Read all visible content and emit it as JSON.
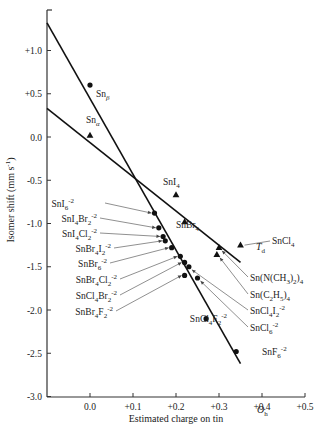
{
  "chart_data": {
    "type": "scatter",
    "title": "",
    "xlabel": "Estimated charge on tin",
    "ylabel": "Isomer shift (mm s⁻¹)",
    "xlim": [
      -0.1,
      0.5
    ],
    "ylim": [
      -3.0,
      1.5
    ],
    "x_ticks": [
      0.0,
      0.1,
      0.2,
      0.3,
      0.4,
      0.5
    ],
    "x_tick_labels": [
      "0.0",
      "+0.1",
      "+0.2",
      "+0.3",
      "+0.4",
      "+0.5"
    ],
    "y_ticks": [
      1.0,
      0.5,
      0.0,
      -0.5,
      -1.0,
      -1.5,
      -2.0,
      -2.5,
      -3.0
    ],
    "y_tick_labels": [
      "+1.0",
      "+0.5",
      "0.0",
      "-0.5",
      "-1.0",
      "-1.5",
      "-2.0",
      "-2.5",
      "-3.0"
    ],
    "grid": false,
    "lines": [
      {
        "name": "Oh",
        "label": "O_h",
        "x": [
          -0.1,
          0.35
        ],
        "y": [
          1.32,
          -2.62
        ]
      },
      {
        "name": "Td",
        "label": "T_d",
        "x": [
          -0.1,
          0.35
        ],
        "y": [
          0.33,
          -1.45
        ]
      }
    ],
    "series": [
      {
        "name": "Octahedral (circles)",
        "marker": "circle",
        "points": [
          {
            "label": "Snβ",
            "x": 0.0,
            "y": 0.6
          },
          {
            "label": "SnI6^-2",
            "x": 0.15,
            "y": -0.88
          },
          {
            "label": "SnI4Br2^-2",
            "x": 0.16,
            "y": -1.05
          },
          {
            "label": "SnI4Cl2^-2",
            "x": 0.17,
            "y": -1.15
          },
          {
            "label": "SnBr4I2^-2",
            "x": 0.175,
            "y": -1.2
          },
          {
            "label": "SnBr6^-2",
            "x": 0.19,
            "y": -1.28
          },
          {
            "label": "SnBr4Cl2^-2",
            "x": 0.21,
            "y": -1.38
          },
          {
            "label": "SnCl4Br2^-2",
            "x": 0.22,
            "y": -1.45
          },
          {
            "label": "SnBr4F2^-2",
            "x": 0.22,
            "y": -1.6
          },
          {
            "label": "SnCl6^-2",
            "x": 0.25,
            "y": -1.63
          },
          {
            "label": "SnCl4I2^-2",
            "x": 0.23,
            "y": -1.5
          },
          {
            "label": "SnCl4F2^-2",
            "x": 0.27,
            "y": -2.1
          },
          {
            "label": "SnF6^-2",
            "x": 0.34,
            "y": -2.48
          }
        ]
      },
      {
        "name": "Tetrahedral (triangles)",
        "marker": "triangle",
        "points": [
          {
            "label": "Snα",
            "x": 0.0,
            "y": 0.02
          },
          {
            "label": "SnI4",
            "x": 0.2,
            "y": -0.67
          },
          {
            "label": "SnBr4",
            "x": 0.22,
            "y": -0.98
          },
          {
            "label": "SnCl4",
            "x": 0.35,
            "y": -1.25
          },
          {
            "label": "Sn(N(CH3)2)4",
            "x": 0.3,
            "y": -1.28
          },
          {
            "label": "Sn(C2H5)4",
            "x": 0.295,
            "y": -1.36
          }
        ]
      }
    ]
  },
  "labels": {
    "xlabel": "Estimated charge on tin",
    "ylabel": "Isomer shift (mm s",
    "ylabel_sup": "-1",
    "ylabel_end": ")",
    "oh": "O",
    "oh_sub": "h",
    "td": "T",
    "td_sub": "d"
  }
}
